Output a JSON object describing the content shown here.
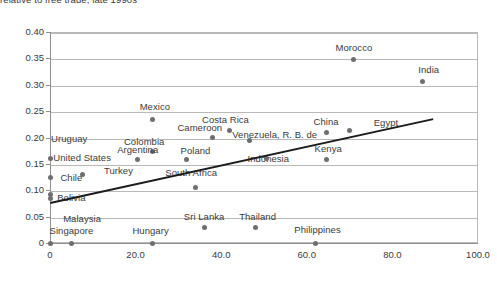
{
  "chart_data": {
    "type": "scatter",
    "title": "relative to free trade, late 1990s",
    "xlabel": "",
    "ylabel": "",
    "xlim": [
      0,
      100
    ],
    "ylim": [
      0,
      0.4
    ],
    "grid": true,
    "legend": "none",
    "xticks": [
      "0",
      "20.0",
      "40.0",
      "60.0",
      "80.0",
      "100.0"
    ],
    "xtick_values": [
      0,
      20,
      40,
      60,
      80,
      100
    ],
    "yticks": [
      "0",
      "0.05",
      "0.10",
      "0.15",
      "0.20",
      "0.25",
      "0.30",
      "0.35",
      "0.40"
    ],
    "ytick_values": [
      0,
      0.05,
      0.1,
      0.15,
      0.2,
      0.25,
      0.3,
      0.35,
      0.4
    ],
    "point_color": "#6e6e6e",
    "grid_color": "#b9b9b9",
    "trendline_color": "#1c1c1c",
    "trendline": {
      "x0": 0,
      "y0": 0.077,
      "x1": 89.5,
      "y1": 0.236
    },
    "points": [
      {
        "label": "Morocco",
        "x": 71.0,
        "y": 0.348,
        "lx": 71.0,
        "ly": 0.368
      },
      {
        "label": "India",
        "x": 87.0,
        "y": 0.307,
        "lx": 88.5,
        "ly": 0.327
      },
      {
        "label": "Mexico",
        "x": 24.0,
        "y": 0.235,
        "lx": 24.5,
        "ly": 0.255
      },
      {
        "label": "Costa Rica",
        "x": 42.0,
        "y": 0.213,
        "lx": 41.0,
        "ly": 0.232
      },
      {
        "label": "China",
        "x": 64.5,
        "y": 0.209,
        "lx": 64.5,
        "ly": 0.228
      },
      {
        "label": "Egypt",
        "x": 70.0,
        "y": 0.213,
        "lx": 78.5,
        "ly": 0.226
      },
      {
        "label": "Cameroon",
        "x": 38.0,
        "y": 0.2,
        "lx": 35.0,
        "ly": 0.216
      },
      {
        "label": "Venezuela, R. B. de",
        "x": 46.5,
        "y": 0.195,
        "lx": 52.5,
        "ly": 0.203
      },
      {
        "label": "Uruguay",
        "x": 0.0,
        "y": 0.16,
        "lx": 4.5,
        "ly": 0.196
      },
      {
        "label": "Colombia",
        "x": 24.0,
        "y": 0.173,
        "lx": 22.0,
        "ly": 0.19
      },
      {
        "label": "Kenya",
        "x": 64.5,
        "y": 0.158,
        "lx": 65.0,
        "ly": 0.177
      },
      {
        "label": "Argentina",
        "x": 20.5,
        "y": 0.158,
        "lx": 20.5,
        "ly": 0.174
      },
      {
        "label": "Poland",
        "x": 32.0,
        "y": 0.158,
        "lx": 34.0,
        "ly": 0.173
      },
      {
        "label": "Indonesia",
        "x": 50.5,
        "y": 0.16,
        "lx": 51.0,
        "ly": 0.157
      },
      {
        "label": "United States",
        "x": 0.0,
        "y": 0.125,
        "lx": 7.5,
        "ly": 0.16
      },
      {
        "label": "Turkey",
        "x": 7.5,
        "y": 0.13,
        "lx": 16.0,
        "ly": 0.134
      },
      {
        "label": "South Africa",
        "x": 34.0,
        "y": 0.106,
        "lx": 33.0,
        "ly": 0.131
      },
      {
        "label": "Chile",
        "x": 0.0,
        "y": 0.091,
        "lx": 5.0,
        "ly": 0.122
      },
      {
        "label": "Bolivia",
        "x": 0.0,
        "y": 0.085,
        "lx": 5.0,
        "ly": 0.083
      },
      {
        "label": "Sri Lanka",
        "x": 36.0,
        "y": 0.03,
        "lx": 36.0,
        "ly": 0.048
      },
      {
        "label": "Thailand",
        "x": 48.0,
        "y": 0.03,
        "lx": 48.5,
        "ly": 0.048
      },
      {
        "label": "Malaysia",
        "x": 5.0,
        "y": 0.0,
        "lx": 7.5,
        "ly": 0.043
      },
      {
        "label": "Singapore",
        "x": 0.0,
        "y": 0.0,
        "lx": 5.0,
        "ly": 0.021
      },
      {
        "label": "Hungary",
        "x": 24.0,
        "y": 0.0,
        "lx": 23.5,
        "ly": 0.021
      },
      {
        "label": "Philippines",
        "x": 62.0,
        "y": 0.0,
        "lx": 62.5,
        "ly": 0.022
      }
    ]
  }
}
